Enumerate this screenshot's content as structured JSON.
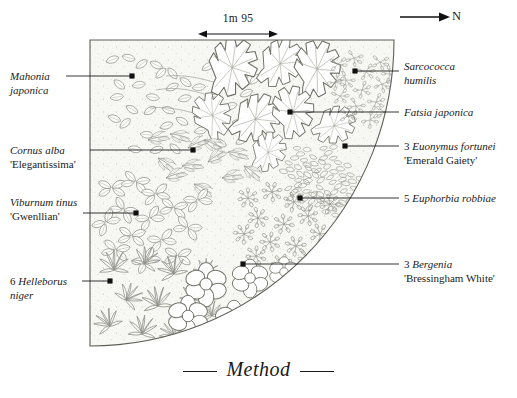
{
  "figure": {
    "caption": "Method",
    "north_label": "N",
    "north_icon": "north-arrow-icon",
    "scale": {
      "text": "1m 95",
      "icon": "double-headed-arrow-icon"
    }
  },
  "bed": {
    "name": "quarter-circle-planting-bed",
    "shape": "quarter-circle",
    "fill": "#fbfbfa",
    "outline": "#6b6b63"
  },
  "labels": [
    {
      "id": "mahonia-japonica",
      "side": "left",
      "qty": "",
      "genus": "Mahonia",
      "species": "japonica",
      "cultivar": "",
      "line1": "Mahonia",
      "line2": "japonica",
      "x": 10,
      "y": 70,
      "leader": {
        "x1": 66,
        "y1": 76,
        "x2": 132,
        "y2": 76
      },
      "dot": {
        "x": 132,
        "y": 76
      }
    },
    {
      "id": "cornus-alba-elegantissima",
      "side": "left",
      "qty": "",
      "genus": "Cornus",
      "species": "alba",
      "cultivar": "'Elegantissima'",
      "line1": "Cornus alba",
      "line2": "'Elegantissima'",
      "x": 10,
      "y": 144,
      "leader": {
        "x1": 90,
        "y1": 150,
        "x2": 193,
        "y2": 150
      },
      "dot": {
        "x": 193,
        "y": 150
      }
    },
    {
      "id": "viburnum-tinus-gwenllian",
      "side": "left",
      "qty": "",
      "genus": "Viburnum",
      "species": "tinus",
      "cultivar": "'Gwenllian'",
      "line1": "Viburnum tinus",
      "line2": "'Gwenllian'",
      "x": 10,
      "y": 196,
      "leader": {
        "x1": 83,
        "y1": 213,
        "x2": 136,
        "y2": 213
      },
      "dot": {
        "x": 136,
        "y": 213
      }
    },
    {
      "id": "helleborus-niger",
      "side": "left",
      "qty": "6",
      "genus": "Helleborus",
      "species": "niger",
      "cultivar": "",
      "line1": "6 Helleborus",
      "line2": "niger",
      "x": 10,
      "y": 275,
      "leader": {
        "x1": 82,
        "y1": 281,
        "x2": 110,
        "y2": 281
      },
      "dot": {
        "x": 110,
        "y": 281
      }
    },
    {
      "id": "sarcococca-humilis",
      "side": "right",
      "qty": "",
      "genus": "Sarcococca",
      "species": "humilis",
      "cultivar": "",
      "line1": "Sarcococca",
      "line2": "humilis",
      "x": 404,
      "y": 60,
      "leader": {
        "x1": 355,
        "y1": 71,
        "x2": 399,
        "y2": 71
      },
      "dot": {
        "x": 355,
        "y": 71
      }
    },
    {
      "id": "fatsia-japonica",
      "side": "right",
      "qty": "",
      "genus": "Fatsia",
      "species": "japonica",
      "cultivar": "",
      "line1": "Fatsia japonica",
      "line2": "",
      "x": 404,
      "y": 106,
      "leader": {
        "x1": 290,
        "y1": 112,
        "x2": 399,
        "y2": 112
      },
      "dot": {
        "x": 290,
        "y": 112
      }
    },
    {
      "id": "euonymus-fortunei-emerald-gaiety",
      "side": "right",
      "qty": "3",
      "genus": "Euonymus",
      "species": "fortunei",
      "cultivar": "'Emerald Gaiety'",
      "line1": "3 Euonymus fortunei",
      "line2": "'Emerald Gaiety'",
      "x": 404,
      "y": 140,
      "leader": {
        "x1": 345,
        "y1": 146,
        "x2": 399,
        "y2": 146
      },
      "dot": {
        "x": 345,
        "y": 146
      }
    },
    {
      "id": "euphorbia-robbiae",
      "side": "right",
      "qty": "5",
      "genus": "Euphorbia",
      "species": "robbiae",
      "cultivar": "",
      "line1": "5 Euphorbia robbiae",
      "line2": "",
      "x": 404,
      "y": 192,
      "leader": {
        "x1": 300,
        "y1": 198,
        "x2": 399,
        "y2": 198
      },
      "dot": {
        "x": 300,
        "y": 198
      }
    },
    {
      "id": "bergenia-bressingham-white",
      "side": "right",
      "qty": "3",
      "genus": "Bergenia",
      "species": "",
      "cultivar": "'Bressingham White'",
      "line1": "3 Bergenia",
      "line2": "'Bressingham White'",
      "x": 404,
      "y": 258,
      "leader": {
        "x1": 243,
        "y1": 264,
        "x2": 399,
        "y2": 264
      },
      "dot": {
        "x": 243,
        "y": 264
      }
    }
  ]
}
